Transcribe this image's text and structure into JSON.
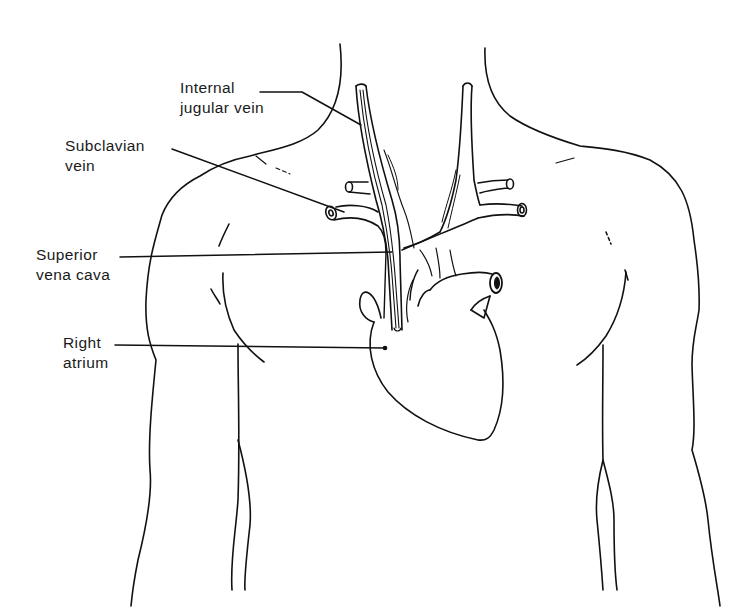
{
  "diagram": {
    "colors": {
      "line": "#111111",
      "background": "#ffffff",
      "text": "#1a1a1a"
    },
    "labels": [
      {
        "id": "internal-jugular-vein",
        "lines": [
          "Internal",
          "jugular vein"
        ]
      },
      {
        "id": "subclavian-vein",
        "lines": [
          "Subclavian",
          "vein"
        ]
      },
      {
        "id": "superior-vena-cava",
        "lines": [
          "Superior",
          "vena cava"
        ]
      },
      {
        "id": "right-atrium",
        "lines": [
          "Right",
          "atrium"
        ]
      }
    ]
  }
}
